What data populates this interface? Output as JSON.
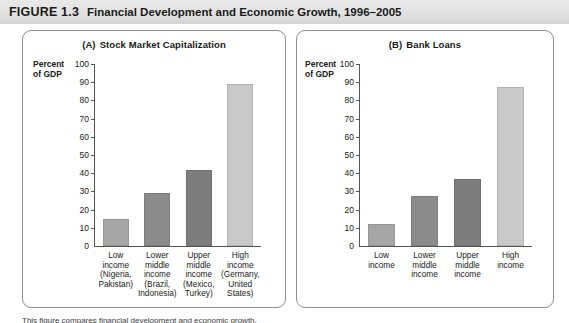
{
  "header": {
    "figure_label": "FIGURE 1.3",
    "title": "Financial Development and Economic Growth, 1996–2005"
  },
  "caption": "This figure compares financial development and economic growth.",
  "colors": {
    "bar_low": "#a6a6a6",
    "bar_lower_middle": "#8c8c8c",
    "bar_upper_middle": "#7d7d7d",
    "bar_high": "#c9c9c9",
    "axis": "#555555",
    "panel_border": "#8e8e8e",
    "header_band": "#e2e2e2"
  },
  "panels": [
    {
      "id": "A",
      "panel_letter": "(A)",
      "panel_title": "Stock Market Capitalization",
      "axis_label": "Percent\nof GDP"
    },
    {
      "id": "B",
      "panel_letter": "(B)",
      "panel_title": "Bank Loans",
      "axis_label": "Percent\nof GDP"
    }
  ],
  "chart_data": [
    {
      "type": "bar",
      "title": "(A)  Stock Market Capitalization",
      "xlabel": "",
      "ylabel": "Percent of GDP",
      "ylim": [
        0,
        100
      ],
      "yticks": [
        0,
        10,
        20,
        30,
        40,
        50,
        60,
        70,
        80,
        90,
        100
      ],
      "grid": false,
      "legend": "none",
      "categories": [
        "Low\nincome\n(Nigeria,\nPakistan)",
        "Lower\nmiddle\nincome\n(Brazil,\nIndonesia)",
        "Upper\nmiddle\nincome\n(Mexico,\nTurkey)",
        "High\nincome\n(Germany,\nUnited\nStates)"
      ],
      "values": [
        15,
        29,
        42,
        89
      ],
      "bar_colors": [
        "#a6a6a6",
        "#8c8c8c",
        "#7d7d7d",
        "#c9c9c9"
      ]
    },
    {
      "type": "bar",
      "title": "(B)  Bank Loans",
      "xlabel": "",
      "ylabel": "Percent of GDP",
      "ylim": [
        0,
        100
      ],
      "yticks": [
        0,
        10,
        20,
        30,
        40,
        50,
        60,
        70,
        80,
        90,
        100
      ],
      "grid": false,
      "legend": "none",
      "categories": [
        "Low\nincome",
        "Lower\nmiddle\nincome",
        "Upper\nmiddle\nincome",
        "High\nincome"
      ],
      "values": [
        12,
        27.5,
        37,
        87.5
      ],
      "bar_colors": [
        "#a6a6a6",
        "#8c8c8c",
        "#7d7d7d",
        "#c9c9c9"
      ]
    }
  ]
}
